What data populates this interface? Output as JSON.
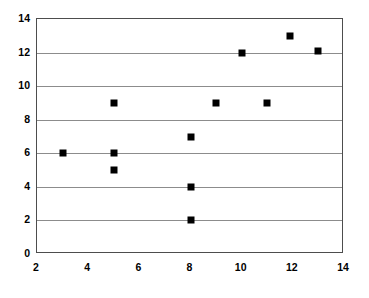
{
  "chart_data": {
    "type": "scatter",
    "title": "",
    "subtitle": "",
    "xlabel": "",
    "ylabel": "",
    "xlim": [
      2,
      14
    ],
    "ylim": [
      0,
      14
    ],
    "xticks": [
      2,
      4,
      6,
      8,
      10,
      12,
      14
    ],
    "yticks": [
      0,
      2,
      4,
      6,
      8,
      10,
      12,
      14
    ],
    "grid": "horizontal",
    "legend": "none",
    "marker": {
      "shape": "square",
      "color": "#000000",
      "size_px": 7
    },
    "series": [
      {
        "name": "",
        "color": "#000000",
        "points": [
          {
            "x": 3,
            "y": 6
          },
          {
            "x": 5,
            "y": 9
          },
          {
            "x": 5,
            "y": 6
          },
          {
            "x": 5,
            "y": 5
          },
          {
            "x": 8,
            "y": 7
          },
          {
            "x": 8,
            "y": 4
          },
          {
            "x": 8,
            "y": 2
          },
          {
            "x": 9,
            "y": 9
          },
          {
            "x": 10,
            "y": 12
          },
          {
            "x": 11,
            "y": 9
          },
          {
            "x": 11.9,
            "y": 13
          },
          {
            "x": 13,
            "y": 12.1
          }
        ]
      }
    ],
    "colors": {
      "marker": "#000000",
      "gridline": "#8c8c8c",
      "axis_border": "#4d4d4d",
      "background": "#ffffff",
      "tick_label": "#000000"
    }
  }
}
